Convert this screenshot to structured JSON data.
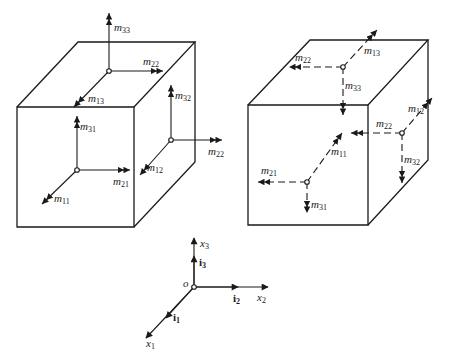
{
  "figure": {
    "left_cube": {
      "title": "positive couple stresses",
      "top_face": {
        "labels": [
          {
            "base": "m",
            "sub": "33"
          },
          {
            "base": "m",
            "sub": "22"
          },
          {
            "base": "m",
            "sub": "13"
          }
        ]
      },
      "front_face": {
        "labels": [
          {
            "base": "m",
            "sub": "31"
          },
          {
            "base": "m",
            "sub": "21"
          },
          {
            "base": "m",
            "sub": "11"
          }
        ]
      },
      "right_face": {
        "labels": [
          {
            "base": "m",
            "sub": "32"
          },
          {
            "base": "m",
            "sub": "22"
          },
          {
            "base": "m",
            "sub": "12"
          }
        ]
      }
    },
    "right_cube": {
      "title": "couple stresses on hidden faces",
      "top_face": {
        "labels": [
          {
            "base": "m",
            "sub": "22"
          },
          {
            "base": "m",
            "sub": "13"
          },
          {
            "base": "m",
            "sub": "33"
          }
        ]
      },
      "front_face": {
        "labels": [
          {
            "base": "m",
            "sub": "21"
          },
          {
            "base": "m",
            "sub": "11"
          },
          {
            "base": "m",
            "sub": "31"
          }
        ]
      },
      "right_face": {
        "labels": [
          {
            "base": "m",
            "sub": "12"
          },
          {
            "base": "m",
            "sub": "22"
          },
          {
            "base": "m",
            "sub": "32"
          }
        ]
      }
    },
    "axes": {
      "origin": "o",
      "x1": {
        "base": "x",
        "sub": "1"
      },
      "x2": {
        "base": "x",
        "sub": "2"
      },
      "x3": {
        "base": "x",
        "sub": "3"
      },
      "i1": {
        "base": "i",
        "sub": "1"
      },
      "i2": {
        "base": "i",
        "sub": "2"
      },
      "i3": {
        "base": "i",
        "sub": "3"
      }
    },
    "colors": {
      "line": "#1a1a1a",
      "background": "#ffffff"
    }
  }
}
